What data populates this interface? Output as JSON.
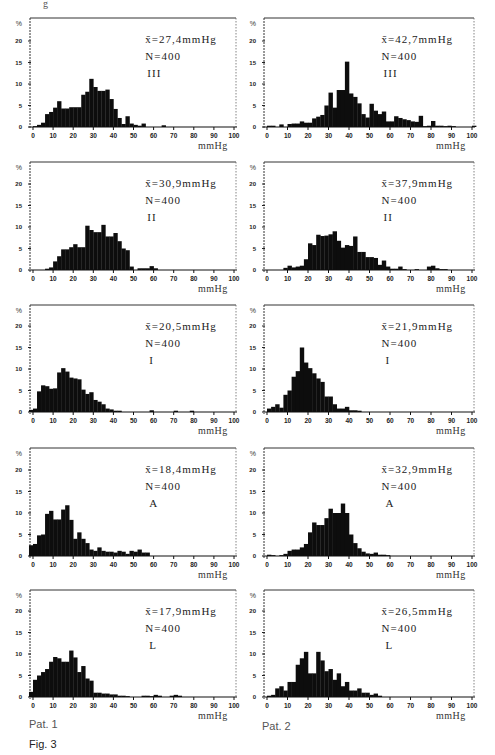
{
  "figure": {
    "caption": "Fig. 3",
    "top_fragment": "g",
    "columns": [
      {
        "label": "Pat. 1"
      },
      {
        "label": "Pat. 2"
      }
    ]
  },
  "axis": {
    "x_ticks": [
      "0",
      "10",
      "20",
      "30",
      "40",
      "50",
      "60",
      "70",
      "80",
      "90",
      "100"
    ],
    "y_ticks": [
      "5",
      "10",
      "15",
      "20"
    ],
    "y_unit": "%",
    "x_unit": "mmHg"
  },
  "chart_data": [
    {
      "type": "bar",
      "patient": "Pat. 1",
      "condition": "III",
      "title": "x̄=27,4mmHg",
      "mean": "x̄=27,4mmHg",
      "n": "N=400",
      "label": "III",
      "xlabel": "mmHg",
      "ylabel": "%",
      "xlim": [
        0,
        100
      ],
      "ylim": [
        0,
        25
      ],
      "bin_width": 2,
      "x": [
        0,
        2,
        4,
        6,
        8,
        10,
        12,
        14,
        16,
        18,
        20,
        22,
        24,
        26,
        28,
        30,
        32,
        34,
        36,
        38,
        40,
        42,
        44,
        46,
        48,
        50,
        52,
        54,
        56,
        58,
        60,
        62,
        64
      ],
      "values": [
        0.2,
        0.5,
        1,
        3,
        3.5,
        4.5,
        6,
        4.3,
        4.3,
        4.6,
        4.6,
        4.6,
        7.5,
        8.2,
        11.2,
        9.3,
        8.4,
        8.4,
        8.7,
        6.5,
        4.2,
        2.1,
        0.7,
        2.5,
        0.8,
        0.5,
        0.3,
        0.8,
        0,
        0,
        0,
        0,
        0.4
      ]
    },
    {
      "type": "bar",
      "patient": "Pat. 2",
      "condition": "III",
      "title": "x̄=42,7mmHg",
      "mean": "x̄=42,7mmHg",
      "n": "N=400",
      "label": "III",
      "xlabel": "mmHg",
      "ylabel": "%",
      "xlim": [
        0,
        100
      ],
      "ylim": [
        0,
        25
      ],
      "bin_width": 2,
      "x": [
        0,
        2,
        4,
        6,
        8,
        10,
        12,
        14,
        16,
        18,
        20,
        22,
        24,
        26,
        28,
        30,
        32,
        34,
        36,
        38,
        40,
        42,
        44,
        46,
        48,
        50,
        52,
        54,
        56,
        58,
        60,
        62,
        64,
        66,
        68,
        70,
        72,
        74,
        76,
        78,
        80,
        82,
        84,
        86,
        88,
        90,
        92,
        94,
        96,
        98,
        100
      ],
      "values": [
        0.3,
        0.3,
        0,
        0.6,
        0,
        0.7,
        0.8,
        0.8,
        1.3,
        1.0,
        1.0,
        2.0,
        2.4,
        2.8,
        5.0,
        8.0,
        4.5,
        8.6,
        8.6,
        15.2,
        7.8,
        7.0,
        5.5,
        3.0,
        2.2,
        5.4,
        3.8,
        3.0,
        3.6,
        1.3,
        1.3,
        2.5,
        2.1,
        1.8,
        1.6,
        1.3,
        1.2,
        2.6,
        0.2,
        0.3,
        1.4,
        0.3,
        0.3,
        0.2,
        0.3,
        0.2,
        0,
        0,
        0,
        0,
        0.3
      ]
    },
    {
      "type": "bar",
      "patient": "Pat. 1",
      "condition": "II",
      "title": "x̄=30,9mmHg",
      "mean": "x̄=30,9mmHg",
      "n": "N=400",
      "label": "II",
      "xlabel": "mmHg",
      "ylabel": "%",
      "xlim": [
        0,
        100
      ],
      "ylim": [
        0,
        25
      ],
      "bin_width": 2,
      "x": [
        0,
        2,
        4,
        6,
        8,
        10,
        12,
        14,
        16,
        18,
        20,
        22,
        24,
        26,
        28,
        30,
        32,
        34,
        36,
        38,
        40,
        42,
        44,
        46,
        48,
        50,
        52,
        54,
        56,
        58,
        60,
        62
      ],
      "values": [
        0,
        0,
        0,
        0.3,
        0.6,
        2.0,
        3.2,
        4.8,
        4.8,
        5.3,
        6.0,
        5.3,
        5.3,
        10.3,
        9.3,
        8.8,
        8.8,
        10.5,
        7.8,
        7.8,
        8.6,
        6.7,
        5.0,
        4.6,
        0.8,
        0,
        0.4,
        0.4,
        0.4,
        0.9,
        0.4,
        0
      ]
    },
    {
      "type": "bar",
      "patient": "Pat. 2",
      "condition": "II",
      "title": "x̄=37,9mmHg",
      "mean": "x̄=37,9mmHg",
      "n": "N=400",
      "label": "II",
      "xlabel": "mmHg",
      "ylabel": "%",
      "xlim": [
        0,
        100
      ],
      "ylim": [
        0,
        25
      ],
      "bin_width": 2,
      "x": [
        0,
        2,
        4,
        6,
        8,
        10,
        12,
        14,
        16,
        18,
        20,
        22,
        24,
        26,
        28,
        30,
        32,
        34,
        36,
        38,
        40,
        42,
        44,
        46,
        48,
        50,
        52,
        54,
        56,
        58,
        60,
        62,
        64,
        66,
        68,
        70,
        72,
        74,
        76,
        78,
        80,
        82,
        84,
        86,
        88
      ],
      "values": [
        0,
        0,
        0,
        0,
        0.5,
        1.0,
        0.6,
        0.8,
        1.0,
        2.5,
        6.2,
        5.8,
        8.2,
        7.9,
        8.0,
        8.3,
        9.0,
        6.8,
        5.2,
        5.8,
        5.6,
        7.8,
        4.2,
        4.2,
        3.0,
        3.0,
        2.8,
        1.2,
        2.2,
        0.8,
        0.3,
        0.3,
        0.8,
        0.2,
        0,
        0,
        0.2,
        0,
        0,
        0.8,
        1.0,
        0.4,
        0.2,
        0.2,
        0
      ]
    },
    {
      "type": "bar",
      "patient": "Pat. 1",
      "condition": "I",
      "title": "x̄=20,5mmHg",
      "mean": "x̄=20,5mmHg",
      "n": "N=400",
      "label": "I",
      "xlabel": "mmHg",
      "ylabel": "%",
      "xlim": [
        0,
        100
      ],
      "ylim": [
        0,
        25
      ],
      "bin_width": 2,
      "x": [
        -2,
        0,
        2,
        4,
        6,
        8,
        10,
        12,
        14,
        16,
        18,
        20,
        22,
        24,
        26,
        28,
        30,
        32,
        34,
        36,
        38,
        40,
        42,
        44,
        46,
        48,
        50,
        52,
        54,
        56,
        58,
        60,
        62,
        64,
        66,
        68,
        70,
        72,
        74,
        76,
        78
      ],
      "values": [
        0.5,
        0.8,
        4.8,
        6.2,
        6.0,
        5.4,
        5.5,
        9.2,
        10.2,
        9.4,
        8.0,
        7.8,
        7.6,
        5.2,
        4.2,
        4.6,
        2.8,
        2.4,
        1.8,
        0.8,
        0.6,
        0.3,
        0.3,
        0,
        0,
        0,
        0,
        0,
        0,
        0,
        0.4,
        0,
        0,
        0,
        0,
        0,
        0.3,
        0,
        0,
        0,
        0.3
      ]
    },
    {
      "type": "bar",
      "patient": "Pat. 2",
      "condition": "I",
      "title": "x̄=21,9mmHg",
      "mean": "x̄=21,9mmHg",
      "n": "N=400",
      "label": "I",
      "xlabel": "mmHg",
      "ylabel": "%",
      "xlim": [
        0,
        100
      ],
      "ylim": [
        0,
        25
      ],
      "bin_width": 2,
      "x": [
        0,
        2,
        4,
        6,
        8,
        10,
        12,
        14,
        16,
        18,
        20,
        22,
        24,
        26,
        28,
        30,
        32,
        34,
        36,
        38,
        40,
        42,
        44,
        46,
        48,
        50
      ],
      "values": [
        0.8,
        1.2,
        1.8,
        1.0,
        4.0,
        5.0,
        8.2,
        9.5,
        15.0,
        11.5,
        10.2,
        9.0,
        7.8,
        7.0,
        3.6,
        3.6,
        1.8,
        0.8,
        0.8,
        1.2,
        0.4,
        0.4,
        0.3,
        0,
        0,
        0
      ]
    },
    {
      "type": "bar",
      "patient": "Pat. 1",
      "condition": "A",
      "title": "x̄=18,4mmHg",
      "mean": "x̄=18,4mmHg",
      "n": "N=400",
      "label": "A",
      "xlabel": "mmHg",
      "ylabel": "%",
      "xlim": [
        0,
        100
      ],
      "ylim": [
        0,
        25
      ],
      "bin_width": 2,
      "x": [
        -2,
        0,
        2,
        4,
        6,
        8,
        10,
        12,
        14,
        16,
        18,
        20,
        22,
        24,
        26,
        28,
        30,
        32,
        34,
        36,
        38,
        40,
        42,
        44,
        46,
        48,
        50,
        52,
        54,
        56
      ],
      "values": [
        2.5,
        2.8,
        4.8,
        5.0,
        9.8,
        10.5,
        8.5,
        8.5,
        10.8,
        11.8,
        8.4,
        4.0,
        5.5,
        4.0,
        3.0,
        1.5,
        1.2,
        2.0,
        1.2,
        1.0,
        1.0,
        0.8,
        1.2,
        1.0,
        0.5,
        1.2,
        1.0,
        1.5,
        0.8,
        0.8
      ]
    },
    {
      "type": "bar",
      "patient": "Pat. 2",
      "condition": "A",
      "title": "x̄=32,9mmHg",
      "mean": "x̄=32,9mmHg",
      "n": "N=400",
      "label": "A",
      "xlabel": "mmHg",
      "ylabel": "%",
      "xlim": [
        0,
        100
      ],
      "ylim": [
        0,
        25
      ],
      "bin_width": 2,
      "x": [
        0,
        2,
        4,
        6,
        8,
        10,
        12,
        14,
        16,
        18,
        20,
        22,
        24,
        26,
        28,
        30,
        32,
        34,
        36,
        38,
        40,
        42,
        44,
        46,
        48,
        50,
        52,
        54,
        56,
        58,
        60
      ],
      "values": [
        0.3,
        0.2,
        0,
        0.2,
        0.5,
        1.2,
        1.5,
        1.5,
        2.0,
        2.8,
        5.5,
        7.8,
        7.2,
        7.2,
        8.8,
        11.0,
        10.0,
        10.0,
        12.2,
        10.0,
        5.0,
        3.0,
        1.8,
        1.0,
        0.6,
        0.5,
        0.8,
        0.3,
        0.3,
        0.2,
        0
      ]
    },
    {
      "type": "bar",
      "patient": "Pat. 1",
      "condition": "L",
      "title": "x̄=17,9mmHg",
      "mean": "x̄=17,9mmHg",
      "n": "N=400",
      "label": "L",
      "xlabel": "mmHg",
      "ylabel": "%",
      "xlim": [
        0,
        100
      ],
      "ylim": [
        0,
        25
      ],
      "bin_width": 2,
      "x": [
        -2,
        0,
        2,
        4,
        6,
        8,
        10,
        12,
        14,
        16,
        18,
        20,
        22,
        24,
        26,
        28,
        30,
        32,
        34,
        36,
        38,
        40,
        42,
        44,
        46,
        48,
        50,
        52,
        54,
        56,
        58,
        60,
        62,
        64,
        66,
        68,
        70,
        72
      ],
      "values": [
        1.2,
        4.0,
        5.0,
        5.8,
        6.5,
        8.2,
        9.3,
        9.0,
        8.2,
        8.2,
        10.8,
        9.2,
        5.8,
        7.2,
        4.3,
        3.8,
        1.0,
        1.0,
        0.8,
        0.8,
        0.6,
        0.6,
        0.3,
        0.3,
        0.2,
        0,
        0,
        0,
        0.3,
        0.3,
        0.2,
        0.5,
        0.3,
        0,
        0,
        0.3,
        0.5,
        0.3
      ]
    },
    {
      "type": "bar",
      "patient": "Pat. 2",
      "condition": "L",
      "title": "x̄=26,5mmHg",
      "mean": "x̄=26,5mmHg",
      "n": "N=400",
      "label": "L",
      "xlabel": "mmHg",
      "ylabel": "%",
      "xlim": [
        0,
        100
      ],
      "ylim": [
        0,
        25
      ],
      "bin_width": 2,
      "x": [
        0,
        2,
        4,
        6,
        8,
        10,
        12,
        14,
        16,
        18,
        20,
        22,
        24,
        26,
        28,
        30,
        32,
        34,
        36,
        38,
        40,
        42,
        44,
        46,
        48,
        50,
        52,
        54,
        56
      ],
      "values": [
        0.3,
        0.5,
        2.0,
        2.5,
        1.5,
        3.5,
        3.5,
        7.5,
        9.0,
        10.5,
        5.5,
        5.5,
        10.5,
        8.5,
        6.0,
        6.5,
        4.0,
        5.5,
        2.5,
        3.5,
        1.5,
        1.5,
        2.0,
        1.0,
        1.0,
        0.5,
        0.8,
        0.3,
        0
      ]
    }
  ]
}
